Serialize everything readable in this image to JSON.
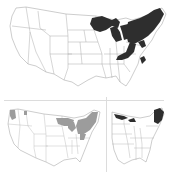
{
  "figure": {
    "panels": [
      {
        "id": "top",
        "description": "Contiguous US map with range shaded dark across Great Lakes and Northeast",
        "fill_color": "#2e2e2e",
        "shaded_regions": [
          "Minnesota",
          "Wisconsin",
          "Michigan",
          "Northern Ohio",
          "Pennsylvania",
          "New York",
          "New England",
          "Appalachians",
          "Virginia coast"
        ]
      },
      {
        "id": "bottom-left",
        "description": "Contiguous US map with range shaded light gray in Pacific Northwest, Great Lakes and Northeast",
        "fill_color": "#9c9c9c",
        "shaded_regions": [
          "Western Washington",
          "Northern Idaho",
          "Minnesota",
          "Wisconsin",
          "Michigan",
          "New York",
          "New England",
          "Pennsylvania"
        ]
      },
      {
        "id": "bottom-right",
        "description": "Eastern US map with range shaded dark in northern Great Lakes and Maine",
        "fill_color": "#2e2e2e",
        "shaded_regions": [
          "Northern Minnesota",
          "Upper Michigan",
          "Maine",
          "New Hampshire"
        ]
      }
    ],
    "colors": {
      "background": "#ffffff",
      "state_border": "#9a9a9a",
      "divider": "#dcdcdc"
    }
  }
}
